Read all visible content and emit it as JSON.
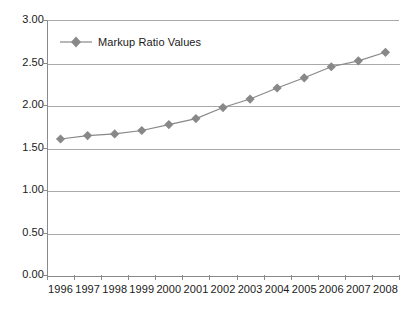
{
  "chart_data": {
    "type": "line",
    "title": "",
    "subtitle": "",
    "xlabel": "",
    "ylabel": "",
    "categories": [
      "1996",
      "1997",
      "1998",
      "1999",
      "2000",
      "2001",
      "2002",
      "2003",
      "2004",
      "2005",
      "2006",
      "2007",
      "2008"
    ],
    "series": [
      {
        "name": "Markup Ratio Values",
        "values": [
          1.6,
          1.64,
          1.66,
          1.7,
          1.77,
          1.84,
          1.97,
          2.07,
          2.2,
          2.32,
          2.45,
          2.52,
          2.62
        ],
        "color": "#888888",
        "marker": "diamond"
      }
    ],
    "ylim": [
      0.0,
      3.0
    ],
    "ytick_labels": [
      "3.00",
      "2.50",
      "2.00",
      "1.50",
      "1.00",
      "0.50",
      "0.00"
    ],
    "ytick_values": [
      3.0,
      2.5,
      2.0,
      1.5,
      1.0,
      0.5,
      0.0
    ],
    "grid": "horizontal",
    "legend_position": "top-left",
    "legend_entries": [
      "Markup Ratio Values"
    ],
    "annotations": []
  },
  "colors": {
    "series": "#888888",
    "grid": "#a9a9a9",
    "axis": "#8a8a8a",
    "text": "#1a1a1a",
    "background": "#ffffff"
  }
}
